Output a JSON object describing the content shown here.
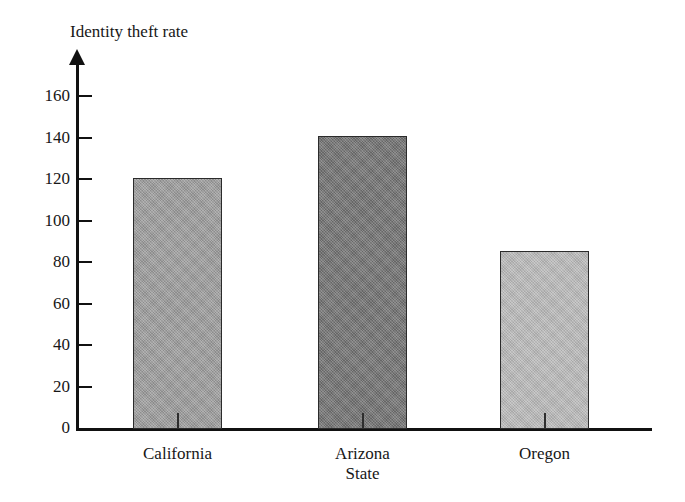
{
  "chart_data": {
    "type": "bar",
    "title": "Identity theft rate",
    "xlabel": "State",
    "ylabel": "Identity theft rate",
    "categories": [
      "California",
      "Arizona",
      "Oregon"
    ],
    "values": [
      121,
      141,
      86
    ],
    "series": [
      {
        "name": "Identity theft rate",
        "values": [
          121,
          141,
          86
        ]
      }
    ],
    "bar_colors": [
      "#9a9a9a",
      "#6f6f6f",
      "#b8b8b8"
    ],
    "bar_border_color": "#2b2b2b",
    "ylim": [
      0,
      170
    ],
    "y_ticks": [
      0,
      20,
      40,
      60,
      80,
      100,
      120,
      140,
      160
    ],
    "y_tick_labels": [
      "0",
      "20",
      "40",
      "60",
      "80",
      "100",
      "120",
      "140",
      "160"
    ],
    "grid": false,
    "legend": "none",
    "axis_color": "#111111",
    "background": "#ffffff",
    "y_axis_arrow": true,
    "tick_direction": "inward"
  },
  "figure": {
    "title": "Identity theft rate",
    "x_axis_title": "State",
    "bars": [
      {
        "label": "California",
        "value": 121,
        "color": "#9a9a9a"
      },
      {
        "label": "Arizona",
        "value": 141,
        "color": "#6f6f6f"
      },
      {
        "label": "Oregon",
        "value": 86,
        "color": "#b8b8b8"
      }
    ]
  }
}
